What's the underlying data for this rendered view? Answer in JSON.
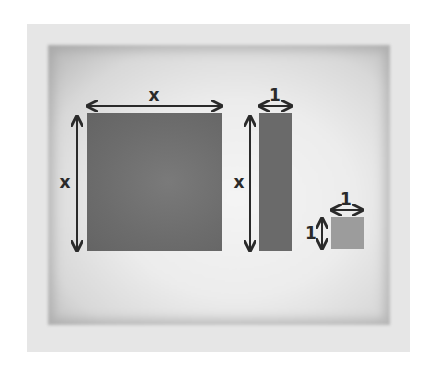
{
  "diagram": {
    "tiles": [
      {
        "name": "x-squared tile",
        "width_label": "x",
        "height_label": "x",
        "color": "#6c6c6c"
      },
      {
        "name": "x tile",
        "width_label": "1",
        "height_label": "x",
        "color": "#6a6a6a"
      },
      {
        "name": "unit tile",
        "width_label": "1",
        "height_label": "1",
        "color": "#9c9c9c"
      }
    ],
    "colors": {
      "frame": "#e6e6e6",
      "arrow": "#2a2a2a",
      "label": "#2a2a2a"
    }
  }
}
